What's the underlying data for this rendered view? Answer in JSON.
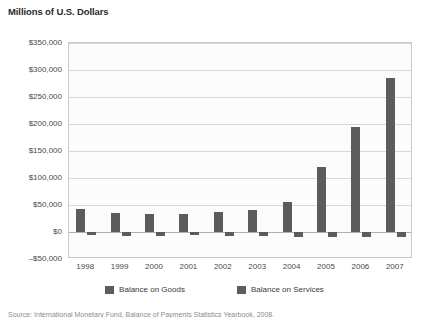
{
  "figure": {
    "title": "Millions of U.S. Dollars",
    "source_note": "Source: International Monetary Fund, Balance of Payments Statistics Yearbook, 2008."
  },
  "legend": {
    "position": "bottom-center",
    "entries": [
      {
        "label": "Balance on Goods",
        "color": "#5c5c5c",
        "swatch_name": "legend-swatch-goods"
      },
      {
        "label": "Balance on Services",
        "color": "#5c5c5c",
        "swatch_name": "legend-swatch-services"
      }
    ]
  },
  "chart_data": {
    "type": "bar",
    "title": "Millions of U.S. Dollars",
    "subtitle": "",
    "xlabel": "",
    "ylabel": "Millions of U.S. Dollars",
    "categories": [
      "1998",
      "1999",
      "2000",
      "2001",
      "2002",
      "2003",
      "2004",
      "2005",
      "2006",
      "2007"
    ],
    "series": [
      {
        "name": "Balance on Goods",
        "color": "#5c5c5c",
        "values": [
          43000,
          36000,
          34000,
          33000,
          37000,
          40000,
          55000,
          120000,
          195000,
          285000
        ]
      },
      {
        "name": "Balance on Services",
        "color": "#5c5c5c",
        "values": [
          -6000,
          -8000,
          -7000,
          -6000,
          -7000,
          -8000,
          -9000,
          -9000,
          -9000,
          -10000
        ]
      }
    ],
    "ylim": [
      -50000,
      350000
    ],
    "yticks": [
      -50000,
      0,
      50000,
      100000,
      150000,
      200000,
      250000,
      300000,
      350000
    ],
    "ytick_labels": [
      "–$50,000",
      "$0",
      "$50,000",
      "$100,000",
      "$150,000",
      "$200,000",
      "$250,000",
      "$300,000",
      "$350,000"
    ],
    "grid": true,
    "legend_position": "bottom"
  }
}
